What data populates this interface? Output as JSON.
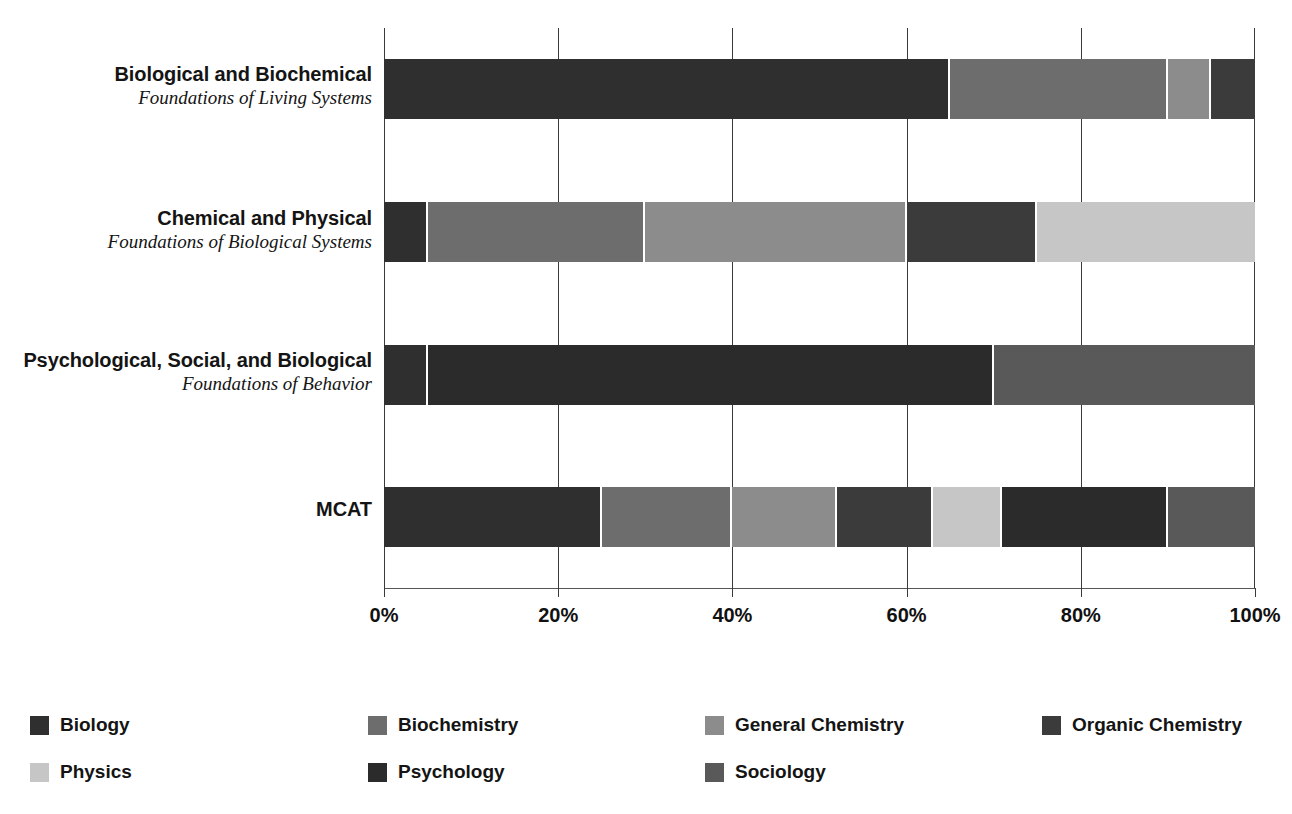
{
  "chart_data": {
    "type": "bar",
    "orientation": "horizontal",
    "stacked": true,
    "normalized_percent": true,
    "title": "",
    "subtitle": "",
    "xlabel": "",
    "ylabel": "",
    "xlim": [
      0,
      100
    ],
    "xticks": [
      0,
      20,
      40,
      60,
      80,
      100
    ],
    "xtick_labels": [
      "0%",
      "20%",
      "40%",
      "60%",
      "80%",
      "100%"
    ],
    "grid": true,
    "grid_axis": "x",
    "legend_position": "bottom",
    "categories": [
      "Biological and Biochemical Foundations of Living Systems",
      "Chemical and Physical Foundations of Biological Systems",
      "Psychological, Social, and Biological Foundations of Behavior",
      "MCAT"
    ],
    "series": [
      {
        "name": "Biology",
        "color": "#2f2f2f",
        "values": [
          65,
          5,
          5,
          25
        ]
      },
      {
        "name": "Biochemistry",
        "color": "#6d6d6d",
        "values": [
          25,
          25,
          0,
          15
        ]
      },
      {
        "name": "General Chemistry",
        "color": "#8c8c8c",
        "values": [
          5,
          30,
          0,
          12
        ]
      },
      {
        "name": "Organic Chemistry",
        "color": "#3b3b3b",
        "values": [
          5,
          15,
          0,
          11
        ]
      },
      {
        "name": "Physics",
        "color": "#c6c6c6",
        "values": [
          0,
          25,
          0,
          8
        ]
      },
      {
        "name": "Psychology",
        "color": "#2b2b2b",
        "values": [
          0,
          0,
          65,
          19
        ]
      },
      {
        "name": "Sociology",
        "color": "#595959",
        "values": [
          0,
          0,
          30,
          10
        ]
      }
    ]
  },
  "rows": [
    {
      "line1": "Biological and Biochemical",
      "line2": "Foundations of Living Systems",
      "segments": [
        {
          "series": "Biology",
          "value": 65,
          "color": "#2f2f2f"
        },
        {
          "series": "Biochemistry",
          "value": 25,
          "color": "#6d6d6d"
        },
        {
          "series": "General Chemistry",
          "value": 5,
          "color": "#8c8c8c"
        },
        {
          "series": "Organic Chemistry",
          "value": 5,
          "color": "#3b3b3b"
        }
      ]
    },
    {
      "line1": "Chemical and Physical",
      "line2": "Foundations of Biological Systems",
      "segments": [
        {
          "series": "Biology",
          "value": 5,
          "color": "#2f2f2f"
        },
        {
          "series": "Biochemistry",
          "value": 25,
          "color": "#6d6d6d"
        },
        {
          "series": "General Chemistry",
          "value": 30,
          "color": "#8c8c8c"
        },
        {
          "series": "Organic Chemistry",
          "value": 15,
          "color": "#3b3b3b"
        },
        {
          "series": "Physics",
          "value": 25,
          "color": "#c6c6c6"
        }
      ]
    },
    {
      "line1": "Psychological, Social, and Biological",
      "line2": "Foundations of Behavior",
      "segments": [
        {
          "series": "Biology",
          "value": 5,
          "color": "#2f2f2f"
        },
        {
          "series": "Psychology",
          "value": 65,
          "color": "#2b2b2b"
        },
        {
          "series": "Sociology",
          "value": 30,
          "color": "#595959"
        }
      ]
    },
    {
      "line1": "MCAT",
      "line2": "",
      "segments": [
        {
          "series": "Biology",
          "value": 25,
          "color": "#2f2f2f"
        },
        {
          "series": "Biochemistry",
          "value": 15,
          "color": "#6d6d6d"
        },
        {
          "series": "General Chemistry",
          "value": 12,
          "color": "#8c8c8c"
        },
        {
          "series": "Organic Chemistry",
          "value": 11,
          "color": "#3b3b3b"
        },
        {
          "series": "Physics",
          "value": 8,
          "color": "#c6c6c6"
        },
        {
          "series": "Psychology",
          "value": 19,
          "color": "#2b2b2b"
        },
        {
          "series": "Sociology",
          "value": 10,
          "color": "#595959"
        }
      ]
    }
  ],
  "axis": {
    "ticks": [
      {
        "label": "0%",
        "value": 0
      },
      {
        "label": "20%",
        "value": 20
      },
      {
        "label": "40%",
        "value": 40
      },
      {
        "label": "60%",
        "value": 60
      },
      {
        "label": "80%",
        "value": 80
      },
      {
        "label": "100%",
        "value": 100
      }
    ]
  },
  "legend": {
    "items": [
      {
        "label": "Biology",
        "color": "#2f2f2f"
      },
      {
        "label": "Biochemistry",
        "color": "#6d6d6d"
      },
      {
        "label": "General Chemistry",
        "color": "#8c8c8c"
      },
      {
        "label": "Organic Chemistry",
        "color": "#3b3b3b"
      },
      {
        "label": "Physics",
        "color": "#c6c6c6"
      },
      {
        "label": "Psychology",
        "color": "#2b2b2b"
      },
      {
        "label": "Sociology",
        "color": "#595959"
      }
    ]
  }
}
